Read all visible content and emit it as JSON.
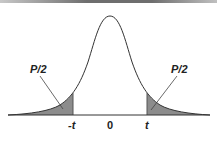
{
  "diagram": {
    "type": "two-tailed t-distribution",
    "labels": {
      "left_tail": "P/2",
      "right_tail": "P/2"
    },
    "ticks": [
      {
        "label": "-t",
        "italic": true
      },
      {
        "label": "0",
        "italic": false
      },
      {
        "label": "t",
        "italic": true
      }
    ],
    "colors": {
      "curve": "#333333",
      "tail_fill": "#8c8c8c",
      "axis": "#333333"
    }
  }
}
